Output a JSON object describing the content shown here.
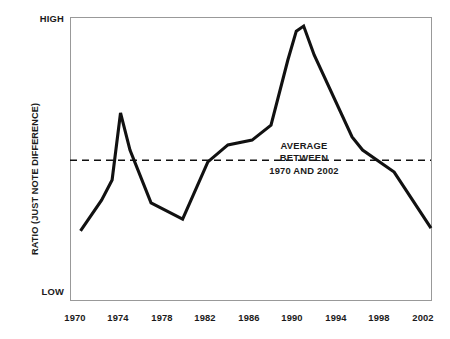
{
  "chart_data": {
    "type": "line",
    "title": "",
    "xlabel": "",
    "ylabel": "RATIO (JUST NOTE DIFFERENCE)",
    "ytick_labels": [
      "HIGH",
      "LOW"
    ],
    "ylim_labels": {
      "top": "HIGH",
      "bottom": "LOW"
    },
    "xlim": [
      1969,
      2003.3
    ],
    "grid": false,
    "legend": false,
    "xtick_labels": [
      "1970",
      "1974",
      "1978",
      "1982",
      "1986",
      "1990",
      "1994",
      "1998",
      "2002"
    ],
    "xticks": [
      1970,
      1974,
      1978,
      1982,
      1986,
      1990,
      1994,
      1998,
      2002
    ],
    "series": [
      {
        "name": "Ratio (just note difference)",
        "color": "#111111",
        "x": [
          1970.0,
          1972.0,
          1973.0,
          1973.8,
          1974.7,
          1976.7,
          1979.7,
          1982.1,
          1984.0,
          1986.3,
          1988.1,
          1989.7,
          1990.5,
          1991.2,
          1992.2,
          1995.8,
          1996.8,
          1999.8,
          2003.3
        ],
        "y": [
          0.244,
          0.353,
          0.424,
          0.661,
          0.53,
          0.343,
          0.286,
          0.488,
          0.548,
          0.565,
          0.618,
          0.848,
          0.95,
          0.968,
          0.866,
          0.576,
          0.53,
          0.452,
          0.254
        ]
      }
    ],
    "reference_line": {
      "label": [
        "AVERAGE",
        "BETWEEN",
        "1970 AND 2002"
      ],
      "value": 0.494,
      "style": "dashed",
      "color": "#111111",
      "orientation": "horizontal"
    },
    "frame": {
      "color": "#999999",
      "visible": true
    }
  },
  "annotation": {
    "line1": "AVERAGE",
    "line2": "BETWEEN",
    "line3": "1970 AND 2002"
  },
  "colors": {
    "line": "#111111",
    "frame": "#9a9a9a",
    "text": "#1a1a1a",
    "background": "#ffffff"
  }
}
